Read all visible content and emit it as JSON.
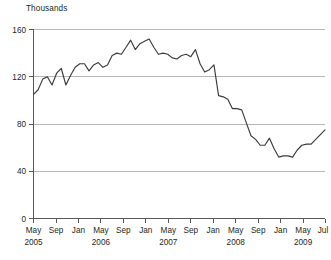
{
  "chart_data": {
    "type": "line",
    "title": "",
    "subtitle": "",
    "units_label": "Thousands",
    "xlabel": "",
    "ylabel": "",
    "ylim": [
      0,
      160
    ],
    "yticks": [
      0,
      40,
      80,
      120,
      160
    ],
    "ytick_labels": [
      "0",
      "40",
      "80",
      "120",
      "160"
    ],
    "grid": "horizontal",
    "legend": "none",
    "x_tick_months": [
      "May",
      "Sep",
      "Jan",
      "May",
      "Sep",
      "Jan",
      "May",
      "Sep",
      "Jan",
      "May",
      "Sep",
      "Jan",
      "May",
      "Jul"
    ],
    "x_tick_years": [
      "2005",
      "",
      "",
      "2006",
      "",
      "",
      "2007",
      "",
      "",
      "2008",
      "",
      "",
      "2009",
      ""
    ],
    "x_start": "May 2005",
    "x_end": "Jul 2009",
    "x": [
      "May 2005",
      "Jun 2005",
      "Jul 2005",
      "Aug 2005",
      "Sep 2005",
      "Oct 2005",
      "Nov 2005",
      "Dec 2005",
      "Jan 2006",
      "Feb 2006",
      "Mar 2006",
      "Apr 2006",
      "May 2006",
      "Jun 2006",
      "Jul 2006",
      "Aug 2006",
      "Sep 2006",
      "Oct 2006",
      "Nov 2006",
      "Dec 2006",
      "Jan 2007",
      "Feb 2007",
      "Mar 2007",
      "Apr 2007",
      "May 2007",
      "Jun 2007",
      "Jul 2007",
      "Aug 2007",
      "Sep 2007",
      "Oct 2007",
      "Nov 2007",
      "Dec 2007",
      "Jan 2008",
      "Feb 2008",
      "Mar 2008",
      "Apr 2008",
      "May 2008",
      "Jun 2008",
      "Jul 2008",
      "Aug 2008",
      "Sep 2008",
      "Oct 2008",
      "Nov 2008",
      "Dec 2008",
      "Jan 2009",
      "Feb 2009",
      "Mar 2009",
      "Apr 2009",
      "May 2009",
      "Jun 2009",
      "Jul 2009"
    ],
    "values": [
      105,
      109,
      118,
      120,
      113,
      123,
      127,
      113,
      121,
      128,
      131,
      131,
      125,
      130,
      132,
      128,
      130,
      138,
      140,
      139,
      145,
      151,
      143,
      148,
      150,
      152,
      145,
      139,
      140,
      139,
      136,
      135,
      138,
      139,
      137,
      143,
      131,
      124,
      126,
      130,
      104,
      103,
      101,
      93,
      93,
      92,
      81,
      70,
      67,
      62,
      62
    ],
    "values_tail": [
      68,
      59,
      52,
      53,
      53,
      52,
      58,
      62,
      63,
      63,
      67,
      71,
      75
    ],
    "series_name": "monthly value",
    "peak_value": 152,
    "peak_at": "Jun 2007",
    "trough_value": 52,
    "trough_at": "Nov 2008",
    "start_value": 105,
    "end_value": 75
  }
}
